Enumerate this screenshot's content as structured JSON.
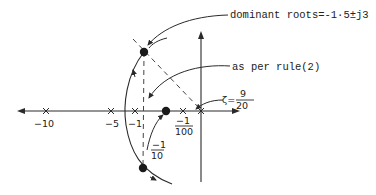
{
  "diagram": {
    "type": "root-locus",
    "annotations": {
      "dominant_roots": "dominant roots=-1·5±j3",
      "rule": "as per rule(2)",
      "zeta_symbol": "ζ=",
      "zeta_num": "9",
      "zeta_den": "20"
    },
    "axis_labels": {
      "m10": "−10",
      "m5": "−5",
      "m1": "−1",
      "m1_100_num": "−1",
      "m1_100_den": "100",
      "m1_10_num": "−1",
      "m1_10_den": "10"
    },
    "colors": {
      "line": "#2a2a2a",
      "background": "#ffffff"
    }
  }
}
